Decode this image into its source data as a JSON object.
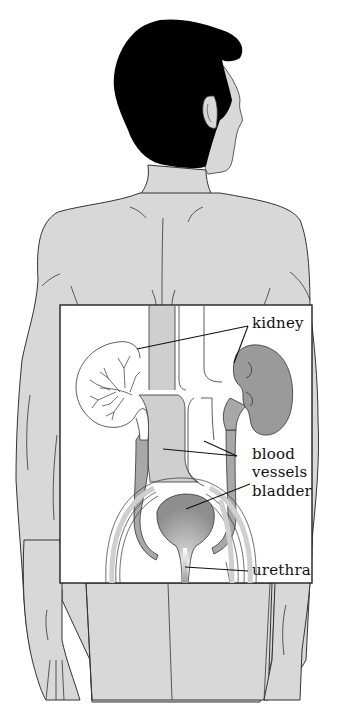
{
  "diagram": {
    "colors": {
      "background": "#ffffff",
      "skin": "#d8d8d8",
      "hair": "#000000",
      "outline": "#333333",
      "inset_background": "#ffffff",
      "kidney_right_fill": "#9a9a9a",
      "kidney_left_fill": "#ffffff",
      "vessel_fill": "#cfcfcf",
      "ureter_fill": "#a8a8a8",
      "bladder_fill": "#9c9c9c",
      "bladder_highlight": "#ffffff"
    },
    "labels": [
      {
        "id": "kidney",
        "text": "kidney",
        "points_to": [
          "left-kidney",
          "right-kidney"
        ]
      },
      {
        "id": "blood_vessels_line1",
        "text": "blood"
      },
      {
        "id": "blood_vessels_line2",
        "text": "vessels",
        "points_to": [
          "aorta",
          "vena-cava"
        ]
      },
      {
        "id": "bladder",
        "text": "bladder",
        "points_to": [
          "bladder"
        ]
      },
      {
        "id": "urethra",
        "text": "urethra",
        "points_to": [
          "urethra"
        ]
      }
    ]
  }
}
